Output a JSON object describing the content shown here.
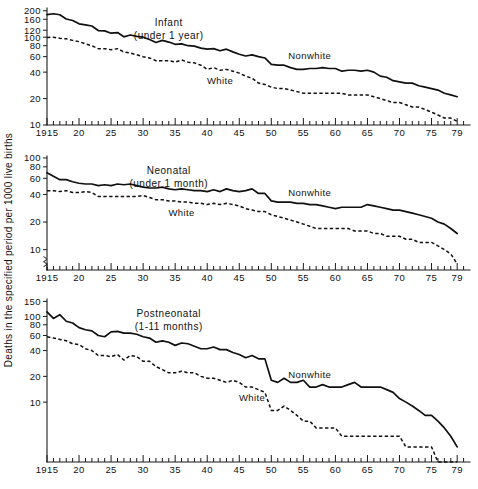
{
  "figure": {
    "y_axis_title": "Deaths in the specified period per 1000 live births",
    "series_labels": {
      "nonwhite": "Nonwhite",
      "white": "White"
    },
    "x_tick_labels": [
      "1915",
      "20",
      "25",
      "30",
      "35",
      "40",
      "45",
      "50",
      "55",
      "60",
      "65",
      "70",
      "75",
      "79"
    ],
    "x_tick_years": [
      1915,
      1920,
      1925,
      1930,
      1935,
      1940,
      1945,
      1950,
      1955,
      1960,
      1965,
      1970,
      1975,
      1979
    ],
    "ink_color": "#101010",
    "background_color": "#ffffff"
  },
  "chart_data": [
    {
      "type": "line",
      "panel": "infant",
      "title": "Infant",
      "subtitle": "(under 1 year)",
      "xlabel": "",
      "ylabel": "Deaths in the specified period per 1000 live births",
      "yscale": "log",
      "ylim": [
        10,
        215
      ],
      "ytick_labels": [
        "200",
        "160",
        "120",
        "100",
        "80",
        "60",
        "40",
        "20",
        "10"
      ],
      "ytick_values": [
        200,
        160,
        120,
        100,
        80,
        60,
        40,
        20,
        10
      ],
      "xlim": [
        1915,
        1981
      ],
      "grid": false,
      "legend_position": "inline-annotation",
      "x": [
        1915,
        1916,
        1917,
        1918,
        1919,
        1920,
        1921,
        1922,
        1923,
        1924,
        1925,
        1926,
        1927,
        1928,
        1929,
        1930,
        1931,
        1932,
        1933,
        1934,
        1935,
        1936,
        1937,
        1938,
        1939,
        1940,
        1941,
        1942,
        1943,
        1944,
        1945,
        1946,
        1947,
        1948,
        1949,
        1950,
        1951,
        1952,
        1953,
        1954,
        1955,
        1956,
        1957,
        1958,
        1959,
        1960,
        1961,
        1962,
        1963,
        1964,
        1965,
        1966,
        1967,
        1968,
        1969,
        1970,
        1971,
        1972,
        1973,
        1974,
        1975,
        1976,
        1977,
        1978,
        1979
      ],
      "series": [
        {
          "name": "Nonwhite",
          "style": "solid",
          "values": [
            181,
            185,
            180,
            161,
            155,
            142,
            138,
            134,
            119,
            118,
            111,
            113,
            101,
            106,
            102,
            100,
            94,
            87,
            92,
            88,
            83,
            84,
            80,
            79,
            75,
            73,
            74,
            70,
            73,
            68,
            64,
            61,
            63,
            60,
            58,
            49,
            48,
            48,
            45,
            43,
            43,
            44,
            44,
            45,
            44,
            44,
            41,
            42,
            42,
            41,
            42,
            40,
            36,
            35,
            32,
            31,
            30,
            30,
            28,
            27,
            26,
            25,
            23,
            22,
            21
          ]
        },
        {
          "name": "White",
          "style": "dashed",
          "values": [
            99,
            100,
            97,
            96,
            92,
            89,
            84,
            80,
            74,
            74,
            72,
            74,
            68,
            66,
            63,
            60,
            58,
            54,
            54,
            54,
            52,
            55,
            52,
            51,
            48,
            43,
            45,
            42,
            43,
            41,
            39,
            36,
            34,
            30,
            29,
            27,
            26,
            26,
            25,
            24,
            23,
            23,
            23,
            23,
            23,
            23,
            23,
            22,
            22,
            22,
            22,
            21,
            20,
            19,
            18,
            18,
            17,
            16,
            16,
            15,
            14,
            13,
            12,
            12,
            11
          ]
        }
      ]
    },
    {
      "type": "line",
      "panel": "neonatal",
      "title": "Neonatal",
      "subtitle": "(under 1 month)",
      "xlabel": "",
      "ylabel": "Deaths in the specified period per 1000 live births",
      "yscale": "log",
      "ylim": [
        6,
        105
      ],
      "ytick_labels": [
        "100",
        "80",
        "60",
        "40",
        "20",
        "10"
      ],
      "ytick_values": [
        100,
        80,
        60,
        40,
        20,
        10
      ],
      "xlim": [
        1915,
        1981
      ],
      "grid": false,
      "axis_break": true,
      "legend_position": "inline-annotation",
      "x": [
        1915,
        1916,
        1917,
        1918,
        1919,
        1920,
        1921,
        1922,
        1923,
        1924,
        1925,
        1926,
        1927,
        1928,
        1929,
        1930,
        1931,
        1932,
        1933,
        1934,
        1935,
        1936,
        1937,
        1938,
        1939,
        1940,
        1941,
        1942,
        1943,
        1944,
        1945,
        1946,
        1947,
        1948,
        1949,
        1950,
        1951,
        1952,
        1953,
        1954,
        1955,
        1956,
        1957,
        1958,
        1959,
        1960,
        1961,
        1962,
        1963,
        1964,
        1965,
        1966,
        1967,
        1968,
        1969,
        1970,
        1971,
        1972,
        1973,
        1974,
        1975,
        1976,
        1977,
        1978,
        1979
      ],
      "series": [
        {
          "name": "Nonwhite",
          "style": "solid",
          "values": [
            69,
            63,
            58,
            58,
            55,
            53,
            52,
            52,
            50,
            51,
            50,
            52,
            51,
            52,
            50,
            48,
            47,
            47,
            48,
            46,
            45,
            46,
            45,
            44,
            44,
            43,
            45,
            43,
            46,
            44,
            43,
            44,
            46,
            41,
            41,
            34,
            33,
            33,
            33,
            32,
            32,
            31,
            31,
            30,
            29,
            28,
            29,
            29,
            29,
            29,
            31,
            30,
            29,
            28,
            27,
            27,
            26,
            25,
            24,
            23,
            22,
            20,
            19,
            17,
            15
          ]
        },
        {
          "name": "White",
          "style": "dashed",
          "values": [
            44,
            44,
            43,
            44,
            42,
            42,
            43,
            42,
            38,
            38,
            38,
            38,
            38,
            38,
            38,
            39,
            37,
            35,
            35,
            34,
            34,
            33,
            33,
            32,
            32,
            31,
            32,
            31,
            32,
            31,
            30,
            28,
            27,
            26,
            26,
            24,
            23,
            22,
            21,
            20,
            19,
            18,
            17,
            17,
            17,
            17,
            17,
            17,
            16,
            16,
            16,
            15,
            15,
            14,
            14,
            14,
            13,
            13,
            12,
            12,
            12,
            11,
            10,
            9,
            7
          ]
        }
      ]
    },
    {
      "type": "line",
      "panel": "postneonatal",
      "title": "Postneonatal",
      "subtitle": "(1-11 months)",
      "xlabel": "",
      "ylabel": "Deaths in the specified period per 1000 live births",
      "yscale": "log",
      "ylim": [
        2,
        160
      ],
      "ytick_labels": [
        "150",
        "100",
        "80",
        "60",
        "40",
        "20",
        "10"
      ],
      "ytick_values": [
        150,
        100,
        80,
        60,
        40,
        20,
        10
      ],
      "xlim": [
        1915,
        1981
      ],
      "grid": false,
      "legend_position": "inline-annotation",
      "x": [
        1915,
        1916,
        1917,
        1918,
        1919,
        1920,
        1921,
        1922,
        1923,
        1924,
        1925,
        1926,
        1927,
        1928,
        1929,
        1930,
        1931,
        1932,
        1933,
        1934,
        1935,
        1936,
        1937,
        1938,
        1939,
        1940,
        1941,
        1942,
        1943,
        1944,
        1945,
        1946,
        1947,
        1948,
        1949,
        1950,
        1951,
        1952,
        1953,
        1954,
        1955,
        1956,
        1957,
        1958,
        1959,
        1960,
        1961,
        1962,
        1963,
        1964,
        1965,
        1966,
        1967,
        1968,
        1969,
        1970,
        1971,
        1972,
        1973,
        1974,
        1975,
        1976,
        1977,
        1978,
        1979
      ],
      "series": [
        {
          "name": "Nonwhite",
          "style": "solid",
          "values": [
            113,
            95,
            105,
            88,
            84,
            74,
            70,
            68,
            60,
            58,
            66,
            67,
            64,
            64,
            62,
            58,
            56,
            50,
            52,
            50,
            46,
            49,
            48,
            45,
            42,
            42,
            44,
            41,
            41,
            38,
            36,
            33,
            35,
            32,
            32,
            18,
            17,
            19,
            17,
            17,
            18,
            15,
            15,
            16,
            15,
            15,
            15,
            16,
            17,
            15,
            15,
            15,
            15,
            14,
            13,
            11,
            10,
            9,
            8,
            7,
            7,
            6,
            5,
            4,
            3
          ]
        },
        {
          "name": "White",
          "style": "dashed",
          "values": [
            58,
            56,
            54,
            52,
            48,
            47,
            42,
            40,
            35,
            35,
            34,
            36,
            31,
            35,
            34,
            30,
            30,
            26,
            24,
            22,
            22,
            23,
            22,
            22,
            20,
            19,
            19,
            18,
            17,
            18,
            17,
            15,
            15,
            14,
            13,
            8,
            8,
            9,
            8,
            7,
            6,
            6,
            5,
            5,
            5,
            5,
            4,
            4,
            4,
            4,
            4,
            4,
            4,
            4,
            4,
            4,
            3,
            3,
            3,
            3,
            3,
            2,
            2,
            2,
            2
          ]
        }
      ]
    }
  ]
}
